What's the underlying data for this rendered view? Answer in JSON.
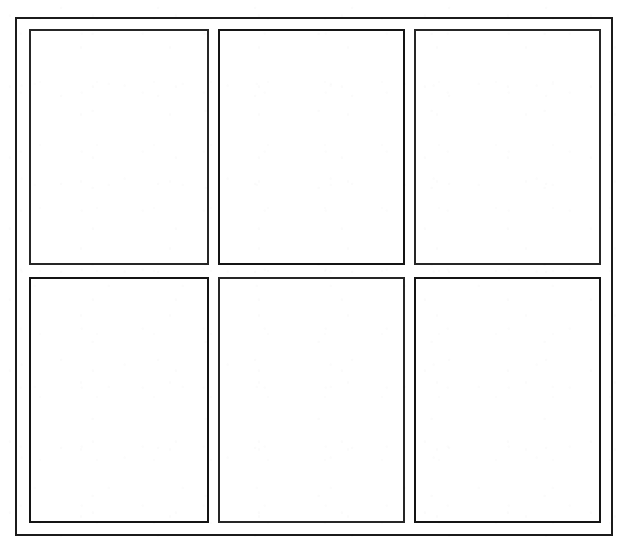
{
  "document": {
    "kind": "scanned-form-page",
    "title": "Blank six-panel grid form",
    "background_color": "#ffffff",
    "ink_color": "#1b1b1b"
  },
  "header": {
    "clipped_text": "",
    "clipped_text_faded": "",
    "clipped_mark": "",
    "note": "Top line of text is cropped by the page edge and is illegible"
  },
  "outer_frame": {
    "label": "outer-border",
    "border_color": "#1b1b1b",
    "border_width_px": 2
  },
  "grid": {
    "columns": 3,
    "rows": 2,
    "panels": [
      {
        "id": "panel-1",
        "position": "row-1-col-1",
        "content": ""
      },
      {
        "id": "panel-2",
        "position": "row-1-col-2",
        "content": ""
      },
      {
        "id": "panel-3",
        "position": "row-1-col-3",
        "content": ""
      },
      {
        "id": "panel-4",
        "position": "row-2-col-1",
        "content": ""
      },
      {
        "id": "panel-5",
        "position": "row-2-col-2",
        "content": ""
      },
      {
        "id": "panel-6",
        "position": "row-2-col-3",
        "content": ""
      }
    ]
  }
}
